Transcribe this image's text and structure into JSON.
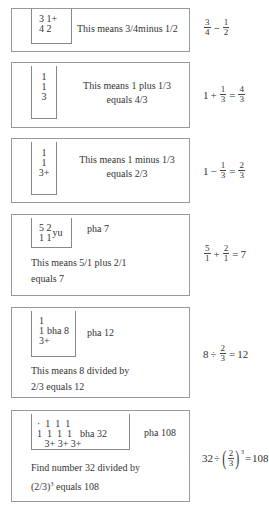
{
  "cards": [
    {
      "grid_rows": [
        "3 1+",
        "4 2"
      ],
      "description": "This means 3/4minus 1/2",
      "formula": {
        "a_num": "3",
        "a_den": "4",
        "op": "−",
        "b_num": "1",
        "b_den": "2"
      }
    },
    {
      "grid_rows": [
        "1",
        "1",
        "3"
      ],
      "description_line1": "This means 1 plus 1/3",
      "description_line2": "equals 4/3",
      "formula": {
        "lead": "1",
        "op": "+",
        "b_num": "1",
        "b_den": "3",
        "eq": "=",
        "r_num": "4",
        "r_den": "3"
      }
    },
    {
      "grid_rows": [
        "1",
        "1",
        "3+"
      ],
      "description_line1": "This means 1 minus 1/3",
      "description_line2": "equals 2/3",
      "formula": {
        "lead": "1",
        "op": "−",
        "b_num": "1",
        "b_den": "3",
        "eq": "=",
        "r_num": "2",
        "r_den": "3"
      }
    },
    {
      "grid_rows": [
        "5 2",
        "1 1"
      ],
      "grid_suffix": "yu",
      "side_label": "pha 7",
      "description_line1": "This means 5/1 plus 2/1",
      "description_line2": "equals 7",
      "formula": {
        "a_num": "5",
        "a_den": "1",
        "op": "+",
        "b_num": "2",
        "b_den": "1",
        "eq": "=",
        "result": "7"
      }
    },
    {
      "grid_rows": [
        "1",
        "1",
        "3+"
      ],
      "grid_suffix": "bha 8",
      "side_label": "pha 12",
      "description_line1": "This means 8 divided by",
      "description_line2": "2/3 equals 12",
      "formula": {
        "lead": "8",
        "op": "÷",
        "b_num": "2",
        "b_den": "3",
        "eq": "=",
        "result": "12"
      }
    },
    {
      "grid_rows": [
        "·  1  1  1",
        "1  1  1  1",
        "   3+ 3+ 3+"
      ],
      "grid_suffix": "bha 32",
      "side_label": "pha 108",
      "description_line1": "Find number 32 divided by",
      "description_line2_prefix": "(2/3)",
      "description_line2_sup": "3",
      "description_line2_suffix": " equals 108",
      "formula": {
        "lead": "32",
        "op": "÷",
        "b_num": "2",
        "b_den": "3",
        "exp": "3",
        "eq": "=",
        "result": "108"
      }
    }
  ]
}
